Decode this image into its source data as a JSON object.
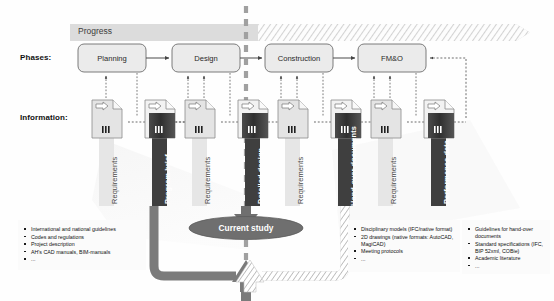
{
  "diagram": {
    "row_labels": {
      "phases": "Phases:",
      "information": "Information:"
    },
    "progress_banner": {
      "label": "Progress"
    },
    "phases": [
      {
        "id": "planning",
        "label": "Planning"
      },
      {
        "id": "design",
        "label": "Design"
      },
      {
        "id": "construction",
        "label": "Construction"
      },
      {
        "id": "fmo",
        "label": "FM&O"
      }
    ],
    "documents": [
      {
        "id": "doc-1",
        "label": "Requirements",
        "style": "light"
      },
      {
        "id": "doc-2",
        "label": "Program brief",
        "style": "dark"
      },
      {
        "id": "doc-3",
        "label": "Requirements",
        "style": "light"
      },
      {
        "id": "doc-4",
        "label": "Detailed design",
        "style": "dark"
      },
      {
        "id": "doc-5",
        "label": "Requirements",
        "style": "light"
      },
      {
        "id": "doc-6",
        "label": "Hand-over documents",
        "style": "dark"
      },
      {
        "id": "doc-7",
        "label": "Requirements",
        "style": "light"
      },
      {
        "id": "doc-8",
        "label": "Performance data",
        "style": "dark"
      }
    ],
    "current_study": {
      "label": "Current study"
    },
    "bullet_lists": [
      {
        "id": "inputs-list",
        "items": [
          "International and national guidelines",
          "Codes and regulations",
          "Project description",
          "AH's CAD manuals, BIM-manuals",
          "..."
        ]
      },
      {
        "id": "deliverables-list",
        "items": [
          "Disciplinary models (IFC/native format)",
          "2D drawings (native formats: AutoCAD, MagiCAD)",
          "Meeting protocols",
          "..."
        ]
      },
      {
        "id": "standards-list",
        "items": [
          "Guidelines for hand-over documents",
          "Standard specifications (IFC, BIP 52xml, COBie)",
          "Academic literature",
          "..."
        ]
      }
    ],
    "colors": {
      "phase_box_fill": "#ebebeb",
      "phase_box_stroke": "#6e6e6e",
      "progress_band": "#dcdcdc",
      "doc_light_fill": "#e4e4e4",
      "doc_dark_fill": "#3a3a3a",
      "caption_light_fill": "#e0e0e0",
      "caption_dark_fill": "#3f3f3f",
      "divider_dashed": "#9a9a9a",
      "ribbon": "#7a7a7a",
      "oval": "#6f6f6f",
      "connector": "#555555"
    }
  }
}
